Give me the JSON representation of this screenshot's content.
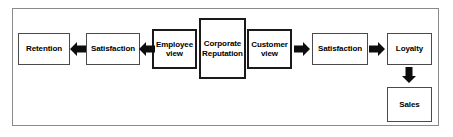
{
  "diagram": {
    "frame": {
      "name": "outer-frame"
    },
    "colors": {
      "frame_border": "#8a8a8a",
      "node_border": "#4a4a4a",
      "node_border_emphasis": "#1a1a1a",
      "arrow_fill": "#0d0d0d",
      "text": "#000000",
      "background": "#ffffff"
    },
    "nodes": [
      {
        "id": "retention",
        "label": "Retention",
        "emphasis": false
      },
      {
        "id": "satisfaction-left",
        "label": "Satisfaction",
        "emphasis": false
      },
      {
        "id": "employee-view",
        "label": "Employee\nview",
        "emphasis": true
      },
      {
        "id": "corporate-reputation",
        "label": "Corporate\nReputation",
        "emphasis": true
      },
      {
        "id": "customer-view",
        "label": "Customer\nview",
        "emphasis": true
      },
      {
        "id": "satisfaction-right",
        "label": "Satisfaction",
        "emphasis": false
      },
      {
        "id": "loyalty",
        "label": "Loyalty",
        "emphasis": false
      },
      {
        "id": "sales",
        "label": "Sales",
        "emphasis": false
      }
    ],
    "node_labels": {
      "retention": "Retention",
      "satisfaction_left": "Satisfaction",
      "employee_view_line1": "Employee",
      "employee_view_line2": "view",
      "corporate_reputation_line1": "Corporate",
      "corporate_reputation_line2": "Reputation",
      "customer_view_line1": "Customer",
      "customer_view_line2": "view",
      "satisfaction_right": "Satisfaction",
      "loyalty": "Loyalty",
      "sales": "Sales"
    },
    "arrows": [
      {
        "id": "arrow-satisfaction-to-retention",
        "direction": "left",
        "from": "satisfaction-left",
        "to": "retention"
      },
      {
        "id": "arrow-employee-view-to-satisfaction",
        "direction": "left",
        "from": "employee-view",
        "to": "satisfaction-left"
      },
      {
        "id": "arrow-customer-view-to-satisfaction",
        "direction": "right",
        "from": "customer-view",
        "to": "satisfaction-right"
      },
      {
        "id": "arrow-satisfaction-to-loyalty",
        "direction": "right",
        "from": "satisfaction-right",
        "to": "loyalty"
      },
      {
        "id": "arrow-loyalty-to-sales",
        "direction": "down",
        "from": "loyalty",
        "to": "sales"
      }
    ]
  }
}
